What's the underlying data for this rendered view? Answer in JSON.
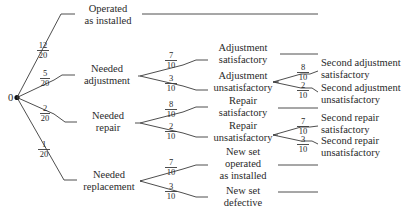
{
  "root": {
    "label": "0"
  },
  "level1": [
    {
      "label_lines": [
        "Operated",
        "as installed"
      ],
      "prob_num": "12",
      "prob_den": "20"
    },
    {
      "label_lines": [
        "Needed",
        "adjustment"
      ],
      "prob_num": "5",
      "prob_den": "20"
    },
    {
      "label_lines": [
        "Needed",
        "repair"
      ],
      "prob_num": "2",
      "prob_den": "20"
    },
    {
      "label_lines": [
        "Needed",
        "replacement"
      ],
      "prob_num": "1",
      "prob_den": "20"
    }
  ],
  "level2": [
    {
      "parent": "Needed adjustment",
      "label_lines": [
        "Adjustment",
        "satisfactory"
      ],
      "prob_num": "7",
      "prob_den": "10"
    },
    {
      "parent": "Needed adjustment",
      "label_lines": [
        "Adjustment",
        "unsatisfactory"
      ],
      "prob_num": "3",
      "prob_den": "10"
    },
    {
      "parent": "Needed repair",
      "label_lines": [
        "Repair",
        "satisfactory"
      ],
      "prob_num": "8",
      "prob_den": "10"
    },
    {
      "parent": "Needed repair",
      "label_lines": [
        "Repair",
        "unsatisfactory"
      ],
      "prob_num": "2",
      "prob_den": "10"
    },
    {
      "parent": "Needed replacement",
      "label_lines": [
        "New set",
        "operated",
        "as installed"
      ],
      "prob_num": "7",
      "prob_den": "10"
    },
    {
      "parent": "Needed replacement",
      "label_lines": [
        "New set",
        "defective"
      ],
      "prob_num": "3",
      "prob_den": "10"
    }
  ],
  "level3": [
    {
      "parent": "Adjustment unsatisfactory",
      "label_lines": [
        "Second adjustment",
        "satisfactory"
      ],
      "prob_num": "8",
      "prob_den": "10"
    },
    {
      "parent": "Adjustment unsatisfactory",
      "label_lines": [
        "Second adjustment",
        "unsatisfactory"
      ],
      "prob_num": "2",
      "prob_den": "10"
    },
    {
      "parent": "Repair unsatisfactory",
      "label_lines": [
        "Second repair",
        "satisfactory"
      ],
      "prob_num": "7",
      "prob_den": "10"
    },
    {
      "parent": "Repair unsatisfactory",
      "label_lines": [
        "Second repair",
        "unsatisfactory"
      ],
      "prob_num": "3",
      "prob_den": "10"
    }
  ]
}
